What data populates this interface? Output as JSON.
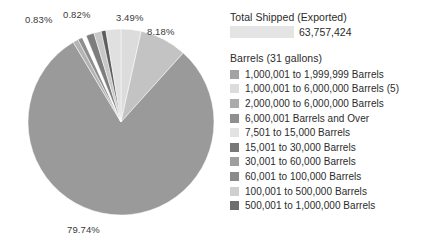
{
  "total": {
    "title": "Total Shipped (Exported)",
    "value": "63,757,424",
    "redacted_swatch": "redacted-field"
  },
  "legend": {
    "title": "Barrels (31 gallons)",
    "items": [
      {
        "label": "1,000,001 to 1,999,999 Barrels",
        "color": "#a3a3a3"
      },
      {
        "label": "1,000,001 to 6,000,000 Barrels (5)",
        "color": "#dcdcdc"
      },
      {
        "label": "2,000,000 to 6,000,000 Barrels",
        "color": "#ababab"
      },
      {
        "label": "6,000,001 Barrels and Over",
        "color": "#8f8f8f"
      },
      {
        "label": "7,501 to 15,000 Barrels",
        "color": "#e2e2e2"
      },
      {
        "label": "15,001 to 30,000 Barrels",
        "color": "#787878"
      },
      {
        "label": "30,001 to 60,000 Barrels",
        "color": "#9e9e9e"
      },
      {
        "label": "60,001 to 100,000 Barrels",
        "color": "#8a8a8a"
      },
      {
        "label": "100,001 to 500,000 Barrels",
        "color": "#cfcfcf"
      },
      {
        "label": "500,001 to 1,000,000 Barrels",
        "color": "#6e6e6e"
      }
    ]
  },
  "chart_data": {
    "type": "pie",
    "title": "",
    "unit": "percent",
    "legend_position": "right",
    "grid": false,
    "center_px": [
      121,
      122
    ],
    "radius_px": 93,
    "start_angle_deg": 0,
    "labels": [
      "3.49%",
      "8.18%",
      "79.74%",
      "0.83%",
      "0.82%"
    ],
    "categories": [
      "7,501 to 15,000 Barrels",
      "100,001 to 500,000 Barrels",
      "1,000,001 to 6,000,000 Barrels (5)",
      "30,001 to 60,000 Barrels",
      "60,001 to 100,000 Barrels",
      "500,001 to 1,000,000 Barrels",
      "15,001 to 30,000 Barrels",
      "1,000,001 to 1,999,999 Barrels",
      "2,000,000 to 6,000,000 Barrels",
      "6,000,001 Barrels and Over"
    ],
    "values": [
      3.49,
      8.18,
      79.74,
      0.83,
      0.82,
      0.94,
      0.71,
      2.6,
      1.4,
      1.29
    ],
    "slices": [
      {
        "label": "3.49%",
        "value": 3.49,
        "color": "#dcdcdc",
        "shown_label": true
      },
      {
        "label": "8.18%",
        "value": 8.18,
        "color": "#c3c3c3",
        "shown_label": true
      },
      {
        "label": "79.74%",
        "value": 79.74,
        "color": "#9a9a9a",
        "shown_label": true
      },
      {
        "label": "",
        "value": 0.94,
        "color": "#b4b4b4",
        "shown_label": false
      },
      {
        "label": "0.83%",
        "value": 0.83,
        "color": "#8e8e8e",
        "shown_label": true
      },
      {
        "label": "",
        "value": 0.71,
        "color": "#ffffff",
        "shown_label": false
      },
      {
        "label": "",
        "value": 1.4,
        "color": "#7d7d7d",
        "shown_label": false
      },
      {
        "label": "",
        "value": 1.29,
        "color": "#c8c8c8",
        "shown_label": false
      },
      {
        "label": "0.82%",
        "value": 0.82,
        "color": "#5e5e5e",
        "shown_label": true
      },
      {
        "label": "",
        "value": 2.6,
        "color": "#e0e0e0",
        "shown_label": false
      }
    ],
    "annotations": [
      {
        "text": "0.83%",
        "x": 25,
        "y": 14
      },
      {
        "text": "0.82%",
        "x": 63,
        "y": 9
      },
      {
        "text": "3.49%",
        "x": 116,
        "y": 12
      },
      {
        "text": "8.18%",
        "x": 147,
        "y": 26
      },
      {
        "text": "79.74%",
        "x": 67,
        "y": 224
      }
    ]
  }
}
